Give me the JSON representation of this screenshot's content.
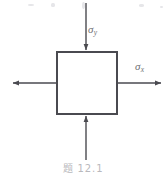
{
  "figure": {
    "caption": "题 12.1",
    "background_color": "#ffffff",
    "stroke_color": "#4a4a50",
    "label_color": "#6f6f74",
    "caption_color": "#b9b9bd",
    "element": {
      "shape_name": "square stress element",
      "left": 56,
      "top": 51,
      "right": 118,
      "bottom": 115,
      "stroke_width": 2
    },
    "labels": [
      {
        "id": "sigma-y",
        "symbol": "σ",
        "subscript": "y",
        "x": 88,
        "y": 24
      },
      {
        "id": "sigma-x",
        "symbol": "σ",
        "subscript": "x",
        "x": 135,
        "y": 61
      }
    ],
    "arrows": [
      {
        "id": "top",
        "direction": "down",
        "label_ref": "sigma-y",
        "x1": 86,
        "y1": 3,
        "x2": 86,
        "y2": 50
      },
      {
        "id": "bottom",
        "direction": "up",
        "label_ref": "sigma-y",
        "x1": 86,
        "y1": 160,
        "x2": 86,
        "y2": 116
      },
      {
        "id": "left",
        "direction": "left",
        "label_ref": "sigma-x",
        "x1": 56,
        "y1": 83,
        "x2": 12,
        "y2": 83
      },
      {
        "id": "right",
        "direction": "right",
        "label_ref": "sigma-x",
        "x1": 118,
        "y1": 83,
        "x2": 162,
        "y2": 83
      }
    ],
    "scan_specks": [
      {
        "x": 28,
        "y": 4,
        "w": 6,
        "h": 2
      },
      {
        "x": 51,
        "y": 3,
        "w": 4,
        "h": 4
      },
      {
        "x": 82,
        "y": 2,
        "w": 3,
        "h": 7
      },
      {
        "x": 139,
        "y": 4,
        "w": 5,
        "h": 3
      },
      {
        "x": 160,
        "y": 6,
        "w": 3,
        "h": 2
      }
    ]
  }
}
